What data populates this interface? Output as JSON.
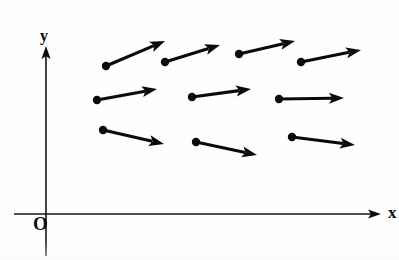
{
  "figure": {
    "background_color": "#fefefe",
    "ink_color": "#0a0a0a",
    "width": 399,
    "height": 260
  },
  "axes": {
    "origin_label": "O",
    "origin_label_position": {
      "x": 33,
      "y": 230
    },
    "x_axis": {
      "label": "x",
      "label_position": {
        "x": 388,
        "y": 218
      },
      "line": {
        "x1": 14,
        "y1": 214,
        "x2": 371,
        "y2": 214
      },
      "arrow_tip": {
        "x": 381,
        "y": 214
      },
      "color": "#151515",
      "width": 1.6
    },
    "y_axis": {
      "label": "y",
      "label_position": {
        "x": 40,
        "y": 41
      },
      "line": {
        "x1": 46,
        "y1": 256,
        "x2": 46,
        "y2": 56
      },
      "arrow_tip": {
        "x": 46,
        "y": 46
      },
      "color": "#151515",
      "width": 1.6
    }
  },
  "chart_data": {
    "type": "scatter",
    "xlabel": "x",
    "ylabel": "y",
    "grid": false,
    "legend": null,
    "origin_label": "O",
    "rows": [
      {
        "row": 1,
        "count": 4,
        "note": "upper row, steepest positive slopes, flattening to the right"
      },
      {
        "row": 2,
        "count": 3,
        "note": "middle row, gentle positive slopes, nearly horizontal at right"
      },
      {
        "row": 3,
        "count": 3,
        "note": "lower row, slightly negative slopes, flattening to the right"
      }
    ],
    "vectors": [
      {
        "id": "v1",
        "row": 1,
        "col": 1,
        "base": {
          "x": 106,
          "y": 66
        },
        "tip": {
          "x": 165,
          "y": 41
        },
        "dx": 59,
        "dy": -25,
        "slope": 0.42,
        "angle_deg": 23.0
      },
      {
        "id": "v2",
        "row": 1,
        "col": 2,
        "base": {
          "x": 165,
          "y": 62
        },
        "tip": {
          "x": 220,
          "y": 45
        },
        "dx": 55,
        "dy": -17,
        "slope": 0.31,
        "angle_deg": 17.2
      },
      {
        "id": "v3",
        "row": 1,
        "col": 3,
        "base": {
          "x": 239,
          "y": 54
        },
        "tip": {
          "x": 295,
          "y": 41
        },
        "dx": 56,
        "dy": -13,
        "slope": 0.23,
        "angle_deg": 13.1
      },
      {
        "id": "v4",
        "row": 1,
        "col": 4,
        "base": {
          "x": 301,
          "y": 62
        },
        "tip": {
          "x": 361,
          "y": 50
        },
        "dx": 60,
        "dy": -12,
        "slope": 0.2,
        "angle_deg": 11.3
      },
      {
        "id": "v5",
        "row": 2,
        "col": 1,
        "base": {
          "x": 97,
          "y": 100
        },
        "tip": {
          "x": 157,
          "y": 89
        },
        "dx": 60,
        "dy": -11,
        "slope": 0.18,
        "angle_deg": 10.4
      },
      {
        "id": "v6",
        "row": 2,
        "col": 2,
        "base": {
          "x": 192,
          "y": 97
        },
        "tip": {
          "x": 251,
          "y": 89
        },
        "dx": 59,
        "dy": -8,
        "slope": 0.14,
        "angle_deg": 7.7
      },
      {
        "id": "v7",
        "row": 2,
        "col": 3,
        "base": {
          "x": 279,
          "y": 99
        },
        "tip": {
          "x": 344,
          "y": 98
        },
        "dx": 65,
        "dy": -1,
        "slope": 0.02,
        "angle_deg": 0.9
      },
      {
        "id": "v8",
        "row": 3,
        "col": 1,
        "base": {
          "x": 103,
          "y": 130
        },
        "tip": {
          "x": 164,
          "y": 144
        },
        "dx": 61,
        "dy": 14,
        "slope": -0.23,
        "angle_deg": -12.9
      },
      {
        "id": "v9",
        "row": 3,
        "col": 2,
        "base": {
          "x": 196,
          "y": 142
        },
        "tip": {
          "x": 257,
          "y": 155
        },
        "dx": 61,
        "dy": 13,
        "slope": -0.21,
        "angle_deg": -12.0
      },
      {
        "id": "v10",
        "row": 3,
        "col": 3,
        "base": {
          "x": 292,
          "y": 137
        },
        "tip": {
          "x": 355,
          "y": 145
        },
        "dx": 63,
        "dy": 8,
        "slope": -0.13,
        "angle_deg": -7.2
      }
    ],
    "style": {
      "shaft_width": 3.1,
      "dot_radius": 4.2,
      "arrowhead_length": 15,
      "arrowhead_half_width": 5.5
    }
  }
}
